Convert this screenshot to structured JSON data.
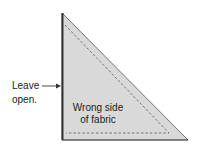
{
  "labels": {
    "leave_line1": "Leave",
    "leave_line2": "open.",
    "fabric_line1": "Wrong side",
    "fabric_line2": "of fabric"
  },
  "colors": {
    "fill": "#d9d9d9",
    "edge": "#333333",
    "dash": "#666666"
  },
  "shape": {
    "type": "right-triangle",
    "vertices": [
      [
        62,
        13
      ],
      [
        62,
        140
      ],
      [
        188,
        140
      ]
    ]
  }
}
